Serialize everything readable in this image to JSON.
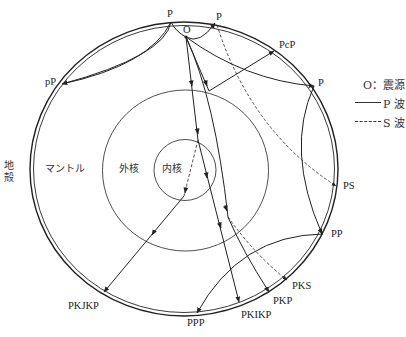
{
  "diagram": {
    "title": "",
    "colors": {
      "line": "#222222",
      "background": "#ffffff"
    },
    "layers": {
      "crust": "地殻",
      "mantle": "マントル",
      "outer_core": "外核",
      "inner_core": "内核"
    },
    "points": {
      "source": "O",
      "p_top_left": "P",
      "p_top_right": "P",
      "p_right": "P"
    },
    "phases": {
      "pP": "pP",
      "PcP": "PcP",
      "PS": "PS",
      "PP": "PP",
      "PKS": "PKS",
      "PKP": "PKP",
      "PKIKP": "PKIKP",
      "PPP": "PPP",
      "PKJKP": "PKJKP"
    },
    "legend": {
      "source": "O：震源",
      "p_wave": "P 波",
      "s_wave": "S 波",
      "p_wave_style": "solid",
      "s_wave_style": "dashed"
    }
  }
}
